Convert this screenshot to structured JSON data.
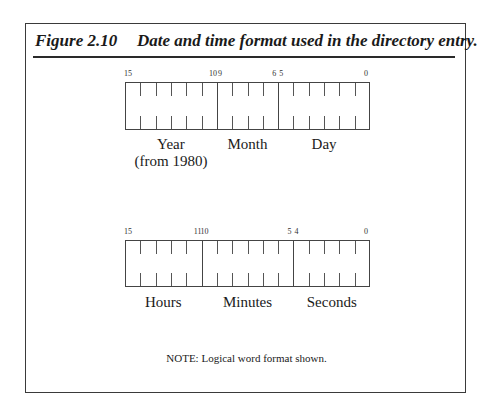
{
  "figure": {
    "number": "Figure 2.10",
    "caption": "Date and time format used in the directory entry.",
    "note": "NOTE: Logical word format shown."
  },
  "date_register": {
    "bit_labels": [
      {
        "bit": "15",
        "cell": 0,
        "side": "left"
      },
      {
        "bit": "10",
        "cell": 5,
        "side": "right"
      },
      {
        "bit": "9",
        "cell": 6,
        "side": "left"
      },
      {
        "bit": "6",
        "cell": 9,
        "side": "right"
      },
      {
        "bit": "5",
        "cell": 10,
        "side": "left"
      },
      {
        "bit": "0",
        "cell": 15,
        "side": "right"
      }
    ],
    "fields": [
      {
        "name": "Year",
        "sub": "(from 1980)",
        "start_cell": 0,
        "cells": 6
      },
      {
        "name": "Month",
        "sub": "",
        "start_cell": 6,
        "cells": 4
      },
      {
        "name": "Day",
        "sub": "",
        "start_cell": 10,
        "cells": 6
      }
    ]
  },
  "time_register": {
    "bit_labels": [
      {
        "bit": "15",
        "cell": 0,
        "side": "left"
      },
      {
        "bit": "11",
        "cell": 4,
        "side": "right"
      },
      {
        "bit": "10",
        "cell": 5,
        "side": "left"
      },
      {
        "bit": "5",
        "cell": 10,
        "side": "right"
      },
      {
        "bit": "4",
        "cell": 11,
        "side": "left"
      },
      {
        "bit": "0",
        "cell": 15,
        "side": "right"
      }
    ],
    "fields": [
      {
        "name": "Hours",
        "sub": "",
        "start_cell": 0,
        "cells": 5
      },
      {
        "name": "Minutes",
        "sub": "",
        "start_cell": 5,
        "cells": 6
      },
      {
        "name": "Seconds",
        "sub": "",
        "start_cell": 11,
        "cells": 5
      }
    ]
  },
  "colors": {
    "line": "#444444",
    "text": "#1a1a1a",
    "background": "#ffffff"
  }
}
